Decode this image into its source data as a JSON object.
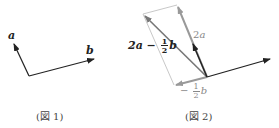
{
  "figures": [
    {
      "caption": "(図 1)",
      "labels": {
        "a": "a",
        "b": "b"
      }
    },
    {
      "caption": "(図 2)",
      "labels": {
        "two_a": "2a",
        "two_a_prefix": "2",
        "two_a_var": "a",
        "combo_prefix": "2a −",
        "combo_frac_num": "1",
        "combo_frac_den": "2",
        "combo_var": "b",
        "neg_half_b_sign": "−",
        "neg_half_b_num": "1",
        "neg_half_b_den": "2",
        "neg_half_b_var": "b"
      }
    }
  ],
  "colors": {
    "primary_vector": "#222222",
    "secondary_vector": "#999999",
    "guide_line": "#c8c8c8",
    "resultant_vector": "#777777"
  }
}
